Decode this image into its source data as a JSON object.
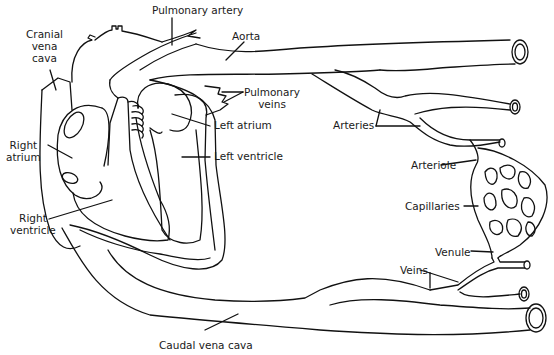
{
  "diagram": {
    "labels": {
      "pulmonary_artery": "Pulmonary artery",
      "cranial_vena_cava": [
        "Cranial",
        "vena",
        "cava"
      ],
      "aorta": "Aorta",
      "pulmonary_veins": [
        "Pulmonary",
        "veins"
      ],
      "left_atrium": "Left atrium",
      "left_ventricle": "Left ventricle",
      "right_atrium": [
        "Right",
        "atrium"
      ],
      "right_ventricle": [
        "Right",
        "ventricle"
      ],
      "arteries": "Arteries",
      "arteriole": "Arteriole",
      "capillaries": "Capillaries",
      "venule": "Venule",
      "veins": "Veins",
      "caudal_vena_cava": "Caudal vena cava"
    },
    "colors": {
      "line": "#111111",
      "background": "#ffffff",
      "text": "#1a1a1a"
    }
  }
}
